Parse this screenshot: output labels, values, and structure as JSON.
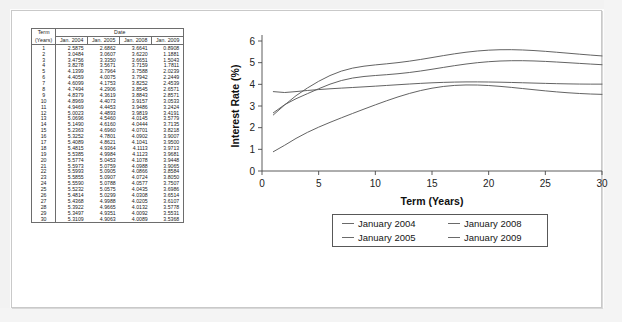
{
  "table": {
    "title_col": "Term",
    "title_col_sub": "(Years)",
    "group_header": "Date",
    "columns": [
      "Jan. 2004",
      "Jan. 2005",
      "Jan. 2008",
      "Jan. 2009"
    ],
    "rows": [
      {
        "term": "1",
        "v": [
          "2.5875",
          "2.6862",
          "3.6641",
          "0.8908"
        ]
      },
      {
        "term": "2",
        "v": [
          "3.0484",
          "3.0607",
          "3.6220",
          "1.1881"
        ]
      },
      {
        "term": "3",
        "v": [
          "3.4756",
          "3.3350",
          "3.6651",
          "1.5043"
        ]
      },
      {
        "term": "4",
        "v": [
          "3.8278",
          "3.5671",
          "3.7159",
          "1.7811"
        ]
      },
      {
        "term": "5",
        "v": [
          "4.1399",
          "3.7964",
          "3.7588",
          "2.0239"
        ]
      },
      {
        "term": "6",
        "v": [
          "4.4059",
          "4.0075",
          "3.7942",
          "2.2449"
        ]
      },
      {
        "term": "7",
        "v": [
          "4.6099",
          "4.1753",
          "3.8252",
          "2.4539"
        ]
      },
      {
        "term": "8",
        "v": [
          "4.7494",
          "4.2906",
          "3.8545",
          "2.6571"
        ]
      },
      {
        "term": "9",
        "v": [
          "4.8379",
          "4.3619",
          "3.8843",
          "2.8571"
        ]
      },
      {
        "term": "10",
        "v": [
          "4.8969",
          "4.4073",
          "3.9157",
          "3.0533"
        ]
      },
      {
        "term": "11",
        "v": [
          "4.9469",
          "4.4453",
          "3.9486",
          "3.2424"
        ]
      },
      {
        "term": "12",
        "v": [
          "5.0023",
          "4.4893",
          "3.9819",
          "3.4191"
        ]
      },
      {
        "term": "13",
        "v": [
          "5.0696",
          "4.5460",
          "4.0145",
          "3.5779"
        ]
      },
      {
        "term": "14",
        "v": [
          "5.1490",
          "4.6160",
          "4.0444",
          "3.7135"
        ]
      },
      {
        "term": "15",
        "v": [
          "5.2363",
          "4.6960",
          "4.0701",
          "3.8218"
        ]
      },
      {
        "term": "16",
        "v": [
          "5.3252",
          "4.7801",
          "4.0902",
          "3.9007"
        ]
      },
      {
        "term": "17",
        "v": [
          "5.4089",
          "4.8621",
          "4.1041",
          "3.9500"
        ]
      },
      {
        "term": "18",
        "v": [
          "5.4815",
          "4.9364",
          "4.1113",
          "3.9713"
        ]
      },
      {
        "term": "19",
        "v": [
          "5.5385",
          "4.9984",
          "4.1123",
          "3.9681"
        ]
      },
      {
        "term": "20",
        "v": [
          "5.5774",
          "5.0453",
          "4.1078",
          "3.9448"
        ]
      },
      {
        "term": "21",
        "v": [
          "5.5973",
          "5.0759",
          "4.0988",
          "3.9065"
        ]
      },
      {
        "term": "22",
        "v": [
          "5.5993",
          "5.0905",
          "4.0866",
          "3.8584"
        ]
      },
      {
        "term": "23",
        "v": [
          "5.5855",
          "5.0907",
          "4.0724",
          "3.8050"
        ]
      },
      {
        "term": "24",
        "v": [
          "5.5590",
          "5.0788",
          "4.0577",
          "3.7507"
        ]
      },
      {
        "term": "25",
        "v": [
          "5.5232",
          "5.0575",
          "4.0435",
          "3.6986"
        ]
      },
      {
        "term": "26",
        "v": [
          "5.4814",
          "5.0299",
          "4.0308",
          "3.6514"
        ]
      },
      {
        "term": "27",
        "v": [
          "5.4368",
          "4.9988",
          "4.0205",
          "3.6107"
        ]
      },
      {
        "term": "28",
        "v": [
          "5.3922",
          "4.9665",
          "4.0132",
          "3.5778"
        ]
      },
      {
        "term": "29",
        "v": [
          "5.3497",
          "4.9351",
          "4.0092",
          "3.5531"
        ]
      },
      {
        "term": "30",
        "v": [
          "5.3109",
          "4.9063",
          "4.0089",
          "3.5368"
        ]
      }
    ]
  },
  "chart_data": {
    "type": "line",
    "title": "",
    "xlabel": "Term (Years)",
    "ylabel": "Interest Rate (%)",
    "xlim": [
      0,
      30
    ],
    "ylim": [
      0,
      6
    ],
    "xticks": [
      0,
      5,
      10,
      15,
      20,
      25,
      30
    ],
    "yticks": [
      0,
      1,
      2,
      3,
      4,
      5,
      6
    ],
    "grid": false,
    "legend_position": "below-axes",
    "line_color": "#5b5b5b",
    "x": [
      1,
      2,
      3,
      4,
      5,
      6,
      7,
      8,
      9,
      10,
      11,
      12,
      13,
      14,
      15,
      16,
      17,
      18,
      19,
      20,
      21,
      22,
      23,
      24,
      25,
      26,
      27,
      28,
      29,
      30
    ],
    "series": [
      {
        "name": "January 2004",
        "values": [
          2.5875,
          3.0484,
          3.4756,
          3.8278,
          4.1399,
          4.4059,
          4.6099,
          4.7494,
          4.8379,
          4.8969,
          4.9469,
          5.0023,
          5.0696,
          5.149,
          5.2363,
          5.3252,
          5.4089,
          5.4815,
          5.5385,
          5.5774,
          5.5973,
          5.5993,
          5.5855,
          5.559,
          5.5232,
          5.4814,
          5.4368,
          5.3922,
          5.3497,
          5.3109
        ]
      },
      {
        "name": "January 2005",
        "values": [
          2.6862,
          3.0607,
          3.335,
          3.5671,
          3.7964,
          4.0075,
          4.1753,
          4.2906,
          4.3619,
          4.4073,
          4.4453,
          4.4893,
          4.546,
          4.616,
          4.696,
          4.7801,
          4.8621,
          4.9364,
          4.9984,
          5.0453,
          5.0759,
          5.0905,
          5.0907,
          5.0788,
          5.0575,
          5.0299,
          4.9988,
          4.9665,
          4.9351,
          4.9063
        ]
      },
      {
        "name": "January 2008",
        "values": [
          3.6641,
          3.622,
          3.6651,
          3.7159,
          3.7588,
          3.7942,
          3.8252,
          3.8545,
          3.8843,
          3.9157,
          3.9486,
          3.9819,
          4.0145,
          4.0444,
          4.0701,
          4.0902,
          4.1041,
          4.1113,
          4.1123,
          4.1078,
          4.0988,
          4.0866,
          4.0724,
          4.0577,
          4.0435,
          4.0308,
          4.0205,
          4.0132,
          4.0092,
          4.0089
        ]
      },
      {
        "name": "January 2009",
        "values": [
          0.8908,
          1.1881,
          1.5043,
          1.7811,
          2.0239,
          2.2449,
          2.4539,
          2.6571,
          2.8571,
          3.0533,
          3.2424,
          3.4191,
          3.5779,
          3.7135,
          3.8218,
          3.9007,
          3.95,
          3.9713,
          3.9681,
          3.9448,
          3.9065,
          3.8584,
          3.805,
          3.7507,
          3.6986,
          3.6514,
          3.6107,
          3.5778,
          3.5531,
          3.5368
        ]
      }
    ]
  },
  "legend": {
    "items": [
      {
        "label": "January 2004"
      },
      {
        "label": "January 2008"
      },
      {
        "label": "January 2005"
      },
      {
        "label": "January 2009"
      }
    ]
  }
}
